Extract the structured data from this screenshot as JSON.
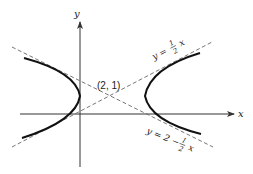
{
  "diagram": {
    "axes": {
      "x_label": "x",
      "y_label": "y"
    },
    "center_point": {
      "label": "(2, 1)",
      "x": 2,
      "y": 1
    },
    "asymptotes": [
      {
        "name": "asymptote-1",
        "equation_prefix": "y = ",
        "frac_num": "1",
        "frac_den": "2",
        "equation_suffix": "x",
        "equation_text": "y = 1/2 x"
      },
      {
        "name": "asymptote-2",
        "equation_prefix": "y = 2 − ",
        "frac_num": "1",
        "frac_den": "2",
        "equation_suffix": "x",
        "equation_text": "y = 2 − 1/2 x"
      }
    ],
    "curves": [
      "left-branch",
      "right-branch"
    ],
    "colors": {
      "curve": "#111111",
      "axes": "#333333",
      "asymptote": "#555555"
    }
  }
}
